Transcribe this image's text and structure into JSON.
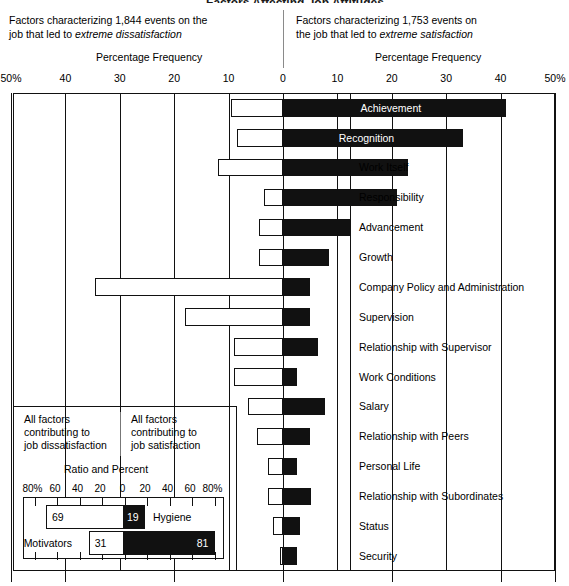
{
  "title_clipped": "Factors Affecting Job Attitudes",
  "captions": {
    "left": "Factors characterizing 1,844 events on the job that led to extreme dissatisfaction",
    "left_plain": "Factors characterizing 1,844 events on the",
    "left_plain2": "job that led to ",
    "left_em": "extreme dissatisfaction",
    "right_plain": "Factors characterizing 1,753 events on",
    "right_plain2": "the job that led to ",
    "right_em": "extreme satisfaction",
    "axis_title_left": "Percentage Frequency",
    "axis_title_right": "Percentage Frequency"
  },
  "axis": {
    "tick_labels": [
      "50%",
      "40",
      "30",
      "20",
      "10",
      "0",
      "10",
      "20",
      "30",
      "40",
      "50%"
    ],
    "tick_values": [
      -50,
      -40,
      -30,
      -20,
      -10,
      0,
      10,
      20,
      30,
      40,
      50
    ],
    "min": -50,
    "max": 50
  },
  "chart_data": {
    "type": "bar",
    "title": "Factors Affecting Job Attitudes",
    "xlabel": "Percentage Frequency",
    "ylabel": "",
    "xlim": [
      -50,
      50
    ],
    "grid": true,
    "legend": "none",
    "orientation": "horizontal-diverging",
    "categories": [
      "Achievement",
      "Recognition",
      "Work Itself",
      "Responsibility",
      "Advancement",
      "Growth",
      "Company Policy and Administration",
      "Supervision",
      "Relationship with Supervisor",
      "Work Conditions",
      "Salary",
      "Relationship with Peers",
      "Personal Life",
      "Relationship with Subordinates",
      "Status",
      "Security"
    ],
    "series": [
      {
        "name": "Factors leading to extreme satisfaction",
        "fill": "black",
        "values": [
          41,
          33,
          23,
          21,
          12.5,
          8.5,
          5,
          5,
          6.5,
          2.5,
          7.8,
          5,
          2.5,
          5.2,
          3.2,
          2.5
        ]
      },
      {
        "name": "Factors leading to extreme dissatisfaction",
        "fill": "white",
        "values": [
          9.5,
          8.5,
          12,
          3.5,
          4.5,
          4.5,
          34.5,
          18,
          9,
          9,
          6.5,
          4.8,
          2.8,
          2.8,
          1.9,
          0.5
        ]
      }
    ],
    "label_inside_bar": [
      true,
      true,
      false,
      false,
      false,
      false,
      false,
      false,
      false,
      false,
      false,
      false,
      false,
      false,
      false,
      false
    ]
  },
  "inset": {
    "caption_left": [
      "All factors",
      "contributing to",
      "job dissatisfaction"
    ],
    "caption_right": [
      "All factors",
      "contributing to",
      "job satisfaction"
    ],
    "title": "Ratio and Percent",
    "tick_labels": [
      "80%",
      "60",
      "40",
      "20",
      "0",
      "20",
      "40",
      "60",
      "80%"
    ],
    "tick_values": [
      -80,
      -60,
      -40,
      -20,
      0,
      20,
      40,
      60,
      80
    ],
    "chart_data": {
      "type": "bar",
      "title": "Ratio and Percent",
      "xlim": [
        -80,
        80
      ],
      "orientation": "horizontal-diverging",
      "categories": [
        "Hygiene",
        "Motivators"
      ],
      "series": [
        {
          "name": "dissatisfaction side",
          "fill": "white",
          "values": [
            69,
            31
          ]
        },
        {
          "name": "satisfaction side",
          "fill": "black",
          "values": [
            19,
            81
          ]
        }
      ]
    },
    "rows": [
      {
        "name": "Hygiene",
        "neg": 69,
        "pos": 19,
        "neg_label": "69",
        "pos_label": "19"
      },
      {
        "name": "Motivators",
        "neg": 31,
        "pos": 81,
        "neg_label": "31",
        "pos_label": "81"
      }
    ]
  }
}
